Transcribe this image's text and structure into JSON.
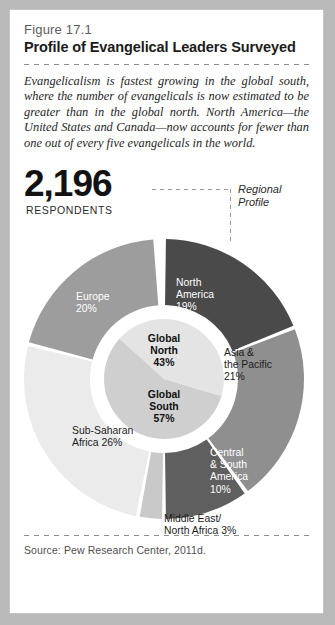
{
  "figure": {
    "number": "Figure 17.1",
    "title": "Profile of Evangelical Leaders Surveyed",
    "blurb": "Evangelicalism is fastest growing in the global south, where the number of evangelicals is now estimated to be greater than in the global north. North America—the United States and Canada—now accounts for fewer than one out of every five evangelicals in the world.",
    "source": "Source:  Pew Research Center, 2011d."
  },
  "stat": {
    "value": "2,196",
    "label": "RESPONDENTS"
  },
  "annotation": {
    "text": "Regional\nProfile"
  },
  "chart_data": {
    "type": "pie",
    "title": "Profile of Evangelical Leaders Surveyed",
    "subtitle": "Regional Profile",
    "total_respondents": 2196,
    "units": "percent of respondents",
    "legend": "none",
    "grid": false,
    "rings": [
      {
        "name": "outer-regions",
        "categories": [
          "North America",
          "Asia & the Pacific",
          "Central & South America",
          "Middle East/North Africa",
          "Sub-Saharan Africa",
          "Europe"
        ],
        "values": [
          19,
          21,
          10,
          3,
          26,
          20
        ],
        "colors": [
          "#4a4a4a",
          "#8f8f8f",
          "#5f5f5f",
          "#c9c9c9",
          "#ebebeb",
          "#9d9d9d"
        ],
        "labels": [
          "North\nAmerica\n19%",
          "Asia &\nthe Pacific\n21%",
          "Central\n& South\nAmerica\n10%",
          "Middle East/\nNorth Africa 3%",
          "Sub-Saharan\nAfrica 26%",
          "Europe\n20%"
        ]
      },
      {
        "name": "inner-hemispheres",
        "categories": [
          "Global North",
          "Global South"
        ],
        "values": [
          43,
          57
        ],
        "colors": [
          "#e4e4e4",
          "#cfcfcf"
        ],
        "labels": [
          "Global\nNorth\n43%",
          "Global\nSouth\n57%"
        ]
      }
    ]
  }
}
